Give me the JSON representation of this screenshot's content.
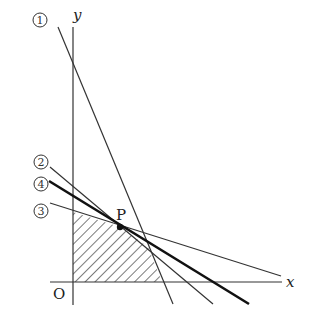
{
  "diagram": {
    "type": "linear-programming-feasible-region",
    "axes": {
      "x_label": "x",
      "y_label": "y",
      "origin_label": "O"
    },
    "lines": [
      {
        "id": "1",
        "label": "①",
        "x1": 58,
        "y1": 27,
        "x2": 173,
        "y2": 304,
        "width": 1.2
      },
      {
        "id": "2",
        "label": "②",
        "x1": 50,
        "y1": 167,
        "x2": 213,
        "y2": 304,
        "width": 1.2
      },
      {
        "id": "3",
        "label": "③",
        "x1": 50,
        "y1": 203,
        "x2": 281,
        "y2": 276,
        "width": 1.2
      },
      {
        "id": "4",
        "label": "④",
        "x1": 49,
        "y1": 181,
        "x2": 249,
        "y2": 304,
        "width": 2.6
      }
    ],
    "point": {
      "label": "P",
      "x": 120,
      "y": 227
    },
    "shaded_region": "0,0 ≤ region bounded by axes, line ③, line ④, line ①"
  }
}
